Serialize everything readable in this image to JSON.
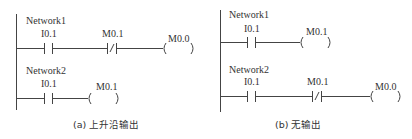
{
  "diagram_type": "ladder-logic",
  "panels": [
    {
      "caption": "(a) 上升沿输出",
      "networks": [
        {
          "title": "Network1",
          "elements": [
            {
              "type": "NO-contact",
              "label": "I0.1"
            },
            {
              "type": "NC-contact",
              "label": "M0.1"
            },
            {
              "type": "coil",
              "label": "M0.0"
            }
          ]
        },
        {
          "title": "Network2",
          "elements": [
            {
              "type": "NO-contact",
              "label": "I0.1"
            },
            {
              "type": "coil",
              "label": "M0.1"
            }
          ]
        }
      ]
    },
    {
      "caption": "(b) 无输出",
      "networks": [
        {
          "title": "Network1",
          "elements": [
            {
              "type": "NO-contact",
              "label": "I0.1"
            },
            {
              "type": "coil",
              "label": "M0.1"
            }
          ]
        },
        {
          "title": "Network2",
          "elements": [
            {
              "type": "NO-contact",
              "label": "I0.1"
            },
            {
              "type": "NC-contact",
              "label": "M0.1"
            },
            {
              "type": "coil",
              "label": "M0.0"
            }
          ]
        }
      ]
    }
  ]
}
